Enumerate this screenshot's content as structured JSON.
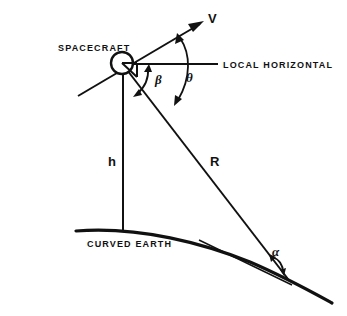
{
  "diagram": {
    "type": "technical-line-diagram",
    "background_color": "#ffffff",
    "ink_color": "#111111",
    "labels": {
      "spacecraft": "SPACECRAFT",
      "local_horizontal": "LOCAL HORIZONTAL",
      "curved_earth": "CURVED EARTH",
      "velocity": "V",
      "altitude": "h",
      "slant_range": "R",
      "beta": "β",
      "theta": "θ",
      "alpha": "α"
    },
    "elements": {
      "spacecraft_marker": "circle-with-right-angle-marker",
      "velocity_vector": "arrow-up-right",
      "local_horizontal_line": "horizontal-reference-line",
      "altitude_line": "vertical-drop-line",
      "slant_range_line": "line-to-ground-point",
      "earth_surface": "convex-curve",
      "ground_tangent": "thin-tangent-line",
      "beta_arc": "double-headed-arc",
      "theta_arc": "double-headed-arc",
      "alpha_arc": "double-headed-arc"
    },
    "geometry": {
      "spacecraft_center": [
        122,
        63
      ],
      "spacecraft_radius": 11,
      "velocity_tip": [
        203,
        22
      ],
      "horizontal_end": [
        218,
        66
      ],
      "ground_point": [
        288,
        278
      ],
      "nadir_point": [
        123,
        232
      ]
    }
  }
}
